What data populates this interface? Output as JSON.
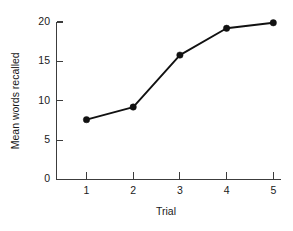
{
  "chart_data": {
    "type": "line",
    "title": "",
    "subtitle": "",
    "xlabel": "Trial",
    "ylabel": "Mean words recalled",
    "x": [
      1,
      2,
      3,
      4,
      5
    ],
    "values": [
      7.6,
      9.2,
      15.8,
      19.2,
      19.9
    ],
    "series": [
      {
        "name": "Mean words recalled",
        "values": [
          7.6,
          9.2,
          15.8,
          19.2,
          19.9
        ],
        "color": "#111111",
        "marker": "filled-circle"
      }
    ],
    "xlim": [
      0.6,
      5.4
    ],
    "ylim": [
      0,
      20
    ],
    "xticks": [
      1,
      2,
      3,
      4,
      5
    ],
    "yticks": [
      0,
      5,
      10,
      15,
      20
    ],
    "xtick_labels": [
      "1",
      "2",
      "3",
      "4",
      "5"
    ],
    "ytick_labels": [
      "0",
      "5",
      "10",
      "15",
      "20"
    ],
    "grid": false,
    "legend": false,
    "legend_position": "none",
    "annotations": [],
    "axis_color": "#3c3c3c",
    "background_color": "#ffffff"
  }
}
